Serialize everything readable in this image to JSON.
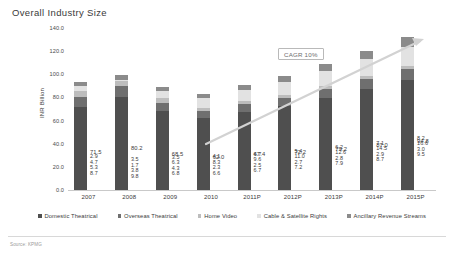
{
  "slide": {
    "title": "Overall Industry Size",
    "footer_note": "Source: KPMG"
  },
  "chart_data": {
    "type": "bar",
    "stacked": true,
    "title": "Overall Industry Size",
    "xlabel": "",
    "ylabel": "INR Billion",
    "ylim": [
      0,
      140
    ],
    "ytick_labels": [
      "140.0",
      "120.0",
      "100.0",
      "80.0",
      "60.0",
      "40.0",
      "20.0",
      "0.0"
    ],
    "yticks": [
      140,
      120,
      100,
      80,
      60,
      40,
      20,
      0
    ],
    "grid": false,
    "legend_position": "bottom",
    "categories": [
      "2007",
      "2008",
      "2009",
      "2010",
      "2011P",
      "2012P",
      "2013P",
      "2014P",
      "2015P"
    ],
    "series": [
      {
        "name": "Domestic Theatrical",
        "color": "#4f4f4f",
        "values": [
          71.5,
          80.2,
          68.5,
          62.0,
          67.4,
          72.2,
          79.2,
          87.0,
          94.8
        ],
        "labels": [
          "71.5",
          "80.2",
          "68.5",
          "62.0",
          "67.4",
          "72.2",
          "79.2",
          "87.0",
          "94.8"
        ]
      },
      {
        "name": "Overseas Theatrical",
        "color": "#6f6f6f",
        "values": [
          8.7,
          9.8,
          6.8,
          6.6,
          6.7,
          7.2,
          7.9,
          8.7,
          9.5
        ],
        "labels": [
          "8.7",
          "9.8",
          "6.8",
          "6.6",
          "6.7",
          "7.2",
          "7.9",
          "8.7",
          "9.5"
        ]
      },
      {
        "name": "Home Video",
        "color": "#bdbdbd",
        "values": [
          5.3,
          3.8,
          4.3,
          2.3,
          2.5,
          2.7,
          2.8,
          2.9,
          3.0
        ],
        "labels": [
          "5.3",
          "3.8",
          "4.3",
          "2.3",
          "2.5",
          "2.7",
          "2.8",
          "2.9",
          "3.0"
        ]
      },
      {
        "name": "Cable & Satellite Rights",
        "color": "#e2e2e2",
        "values": [
          4.7,
          1.7,
          6.3,
          8.3,
          9.6,
          11.0,
          12.6,
          14.5,
          16.6
        ],
        "labels": [
          "4.7",
          "1.7",
          "6.3",
          "8.3",
          "9.6",
          "11.0",
          "12.6",
          "14.5",
          "16.6"
        ]
      },
      {
        "name": "Ancillary Revenue Streams",
        "color": "#8b8b8b",
        "values": [
          2.9,
          3.5,
          3.5,
          4.1,
          4.7,
          5.4,
          6.2,
          7.1,
          8.2
        ],
        "labels": [
          "2.9",
          "3.5",
          "3.5",
          "4.1",
          "4.7",
          "5.4",
          "6.2",
          "7.1",
          "8.2"
        ]
      }
    ],
    "annotations": [
      {
        "text": "CAGR 10%",
        "type": "callout-box"
      }
    ]
  }
}
